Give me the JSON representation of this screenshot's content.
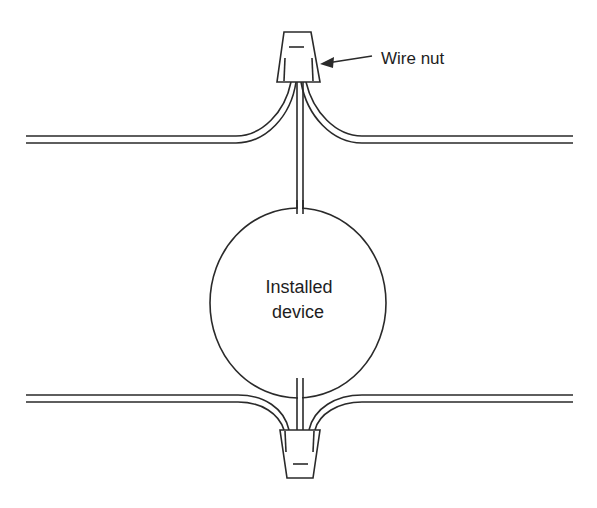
{
  "diagram": {
    "type": "wiring-illustration",
    "labels": {
      "wire_nut": "Wire nut",
      "device_line1": "Installed",
      "device_line2": "device"
    },
    "components": [
      {
        "id": "top-wire-nut",
        "kind": "wire nut",
        "position": "top"
      },
      {
        "id": "bottom-wire-nut",
        "kind": "wire nut",
        "position": "bottom"
      },
      {
        "id": "installed-device",
        "kind": "circle"
      },
      {
        "id": "top-left-cable",
        "kind": "two-conductor wire"
      },
      {
        "id": "top-right-cable",
        "kind": "two-conductor wire"
      },
      {
        "id": "bottom-left-cable",
        "kind": "two-conductor wire"
      },
      {
        "id": "bottom-right-cable",
        "kind": "two-conductor wire"
      },
      {
        "id": "device-lead-top",
        "kind": "lead"
      },
      {
        "id": "device-lead-bottom",
        "kind": "lead"
      }
    ],
    "colors": {
      "line": "#2a2a2a",
      "background": "#ffffff",
      "text": "#1e1e1e"
    }
  }
}
